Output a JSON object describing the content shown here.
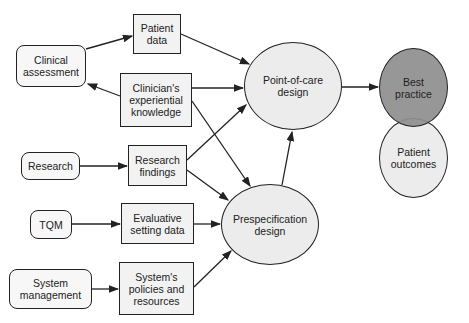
{
  "diagram": {
    "sources": [
      {
        "id": "clinical-assessment",
        "label": "Clinical\nassessment"
      },
      {
        "id": "research",
        "label": "Research"
      },
      {
        "id": "tqm",
        "label": "TQM"
      },
      {
        "id": "system-management",
        "label": "System\nmanagement"
      }
    ],
    "inputs": [
      {
        "id": "patient-data",
        "label": "Patient\ndata"
      },
      {
        "id": "clinicians-knowledge",
        "label": "Clinician's\nexperiential\nknowledge"
      },
      {
        "id": "research-findings",
        "label": "Research\nfindings"
      },
      {
        "id": "evaluative-data",
        "label": "Evaluative\nsetting data"
      },
      {
        "id": "systems-policies",
        "label": "System's\npolicies and\nresources"
      }
    ],
    "designs": [
      {
        "id": "point-of-care",
        "label": "Point-of-care\ndesign"
      },
      {
        "id": "prespecification",
        "label": "Prespecification\ndesign"
      }
    ],
    "outcomes": [
      {
        "id": "best-practice",
        "label": "Best\npractice"
      },
      {
        "id": "patient-outcomes",
        "label": "Patient\noutcomes"
      }
    ],
    "edges": [
      {
        "from": "clinical-assessment",
        "to": "patient-data"
      },
      {
        "from": "clinicians-knowledge",
        "to": "clinical-assessment"
      },
      {
        "from": "patient-data",
        "to": "point-of-care"
      },
      {
        "from": "clinicians-knowledge",
        "to": "point-of-care"
      },
      {
        "from": "clinicians-knowledge",
        "to": "prespecification"
      },
      {
        "from": "research",
        "to": "research-findings"
      },
      {
        "from": "research-findings",
        "to": "point-of-care"
      },
      {
        "from": "research-findings",
        "to": "prespecification"
      },
      {
        "from": "tqm",
        "to": "evaluative-data"
      },
      {
        "from": "evaluative-data",
        "to": "prespecification"
      },
      {
        "from": "system-management",
        "to": "systems-policies"
      },
      {
        "from": "systems-policies",
        "to": "prespecification"
      },
      {
        "from": "prespecification",
        "to": "point-of-care"
      },
      {
        "from": "point-of-care",
        "to": "best-practice"
      }
    ]
  },
  "colors": {
    "stroke": "#222222",
    "box_fill": "#f2f2f2",
    "ellipse_fill": "#ececec",
    "best_practice_fill": "#8e8e8e"
  }
}
